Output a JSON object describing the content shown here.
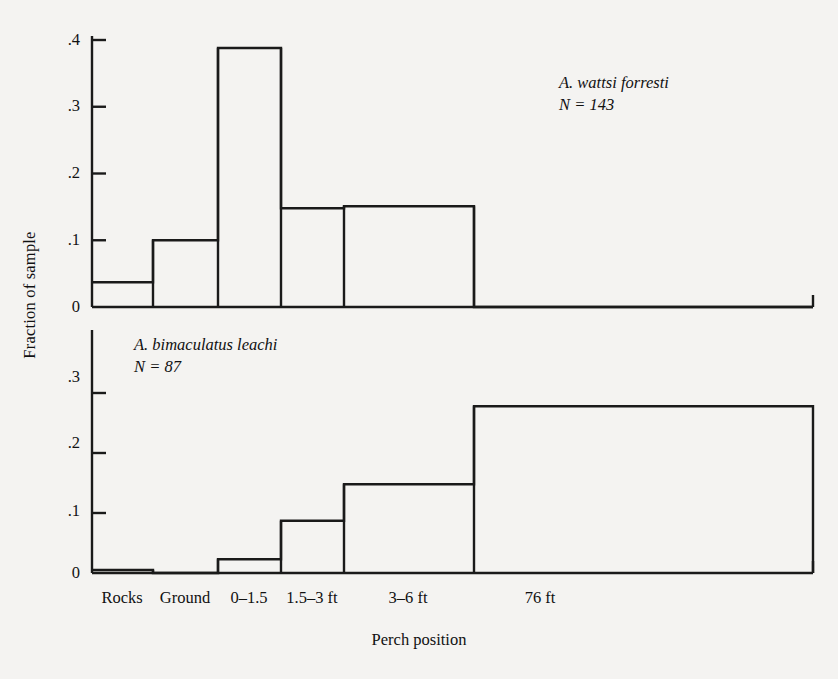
{
  "chart_data": {
    "type": "bar",
    "title": "",
    "xlabel": "Perch position",
    "ylabel": "Fraction of sample",
    "categories": [
      "Rocks",
      "Ground",
      "0–1.5",
      "1.5–3 ft",
      "3–6 ft",
      "76 ft"
    ],
    "grid": false,
    "legend": "none",
    "panels": [
      {
        "name": "A. wattsi forresti",
        "species_label": "A. wattsi forresti",
        "n_label": "N = 143",
        "n": 143,
        "values": [
          0.037,
          0.1,
          0.388,
          0.148,
          0.151,
          0.0
        ],
        "ylim": [
          0,
          0.4
        ],
        "yticks": [
          0,
          0.1,
          0.2,
          0.3,
          0.4
        ],
        "ytick_labels": [
          "0",
          ".1",
          ".2",
          ".3",
          ".4"
        ]
      },
      {
        "name": "A. bimaculatus leachi",
        "species_label": "A. bimaculatus leachi",
        "n_label": "N = 87",
        "n": 87,
        "values": [
          0.005,
          0.0,
          0.023,
          0.087,
          0.148,
          0.278
        ],
        "ylim": [
          0,
          0.33
        ],
        "yticks": [
          0,
          0.1,
          0.2,
          0.3
        ],
        "ytick_labels": [
          "0",
          ".1",
          ".2",
          ".3"
        ]
      }
    ]
  },
  "axis": {
    "top_ticks": [
      {
        "label": ".4",
        "y": 40
      },
      {
        "label": ".3",
        "y": 106
      },
      {
        "label": ".2",
        "y": 173
      },
      {
        "label": ".1",
        "y": 240
      },
      {
        "label": "0",
        "y": 307
      }
    ],
    "bottom_ticks": [
      {
        "label": ".3",
        "y": 377
      },
      {
        "label": ".2",
        "y": 443
      },
      {
        "label": ".1",
        "y": 511
      },
      {
        "label": "0",
        "y": 573
      }
    ],
    "category_label_x": [
      122,
      185,
      249,
      312,
      408,
      540
    ]
  },
  "colors": {
    "background": "#f4f3f1",
    "ink": "#111111",
    "line": "#1a1a1a"
  }
}
